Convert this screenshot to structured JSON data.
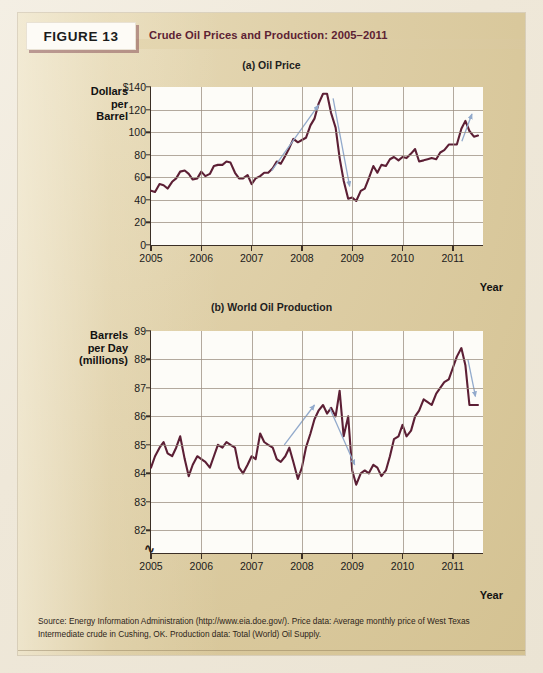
{
  "figure": {
    "label": "FIGURE 13",
    "title": "Crude Oil Prices and Production: 2005–2011",
    "source": "Source: Energy Information Administration (http://www.eia.doe.gov/). Price data: Average monthly price of West Texas Intermediate crude in Cushing, OK. Production data: Total (World) Oil Supply."
  },
  "colors": {
    "line": "#5c1f35",
    "arrow": "#92aacc",
    "panel": "#ddcda4",
    "plot_bg": "#fdfcf8",
    "grid": "#9a8e80",
    "axis": "#3b2f26",
    "title_text": "#5d2233"
  },
  "chart_data": [
    {
      "type": "line",
      "id": "oil-price",
      "title": "(a) Oil Price",
      "ylabel": "Dollars per Barrel",
      "ylabel_lines": [
        "Dollars",
        "per",
        "Barrel"
      ],
      "xlabel": "Year",
      "ytick_labels": [
        "$140",
        "120",
        "100",
        "80",
        "60",
        "40",
        "20",
        "0"
      ],
      "yticks": [
        140,
        120,
        100,
        80,
        60,
        40,
        20,
        0
      ],
      "ylim": [
        0,
        140
      ],
      "xlim": [
        2005.0,
        2011.6
      ],
      "xticks": [
        2005,
        2006,
        2007,
        2008,
        2009,
        2010,
        2011
      ],
      "xtick_labels": [
        "2005",
        "2006",
        "2007",
        "2008",
        "2009",
        "2010",
        "2011"
      ],
      "grid": true,
      "units": "US dollars per barrel",
      "series": [
        {
          "name": "WTI crude spot price",
          "x": [
            2005.0,
            2005.08,
            2005.17,
            2005.25,
            2005.33,
            2005.42,
            2005.5,
            2005.58,
            2005.67,
            2005.75,
            2005.83,
            2005.92,
            2006.0,
            2006.08,
            2006.17,
            2006.25,
            2006.33,
            2006.42,
            2006.5,
            2006.58,
            2006.67,
            2006.75,
            2006.83,
            2006.92,
            2007.0,
            2007.08,
            2007.17,
            2007.25,
            2007.33,
            2007.42,
            2007.5,
            2007.58,
            2007.67,
            2007.75,
            2007.83,
            2007.92,
            2008.0,
            2008.08,
            2008.17,
            2008.25,
            2008.33,
            2008.42,
            2008.5,
            2008.58,
            2008.67,
            2008.75,
            2008.83,
            2008.92,
            2009.0,
            2009.08,
            2009.17,
            2009.25,
            2009.33,
            2009.42,
            2009.5,
            2009.58,
            2009.67,
            2009.75,
            2009.83,
            2009.92,
            2010.0,
            2010.08,
            2010.17,
            2010.25,
            2010.33,
            2010.42,
            2010.5,
            2010.58,
            2010.67,
            2010.75,
            2010.83,
            2010.92,
            2011.0,
            2011.08,
            2011.17,
            2011.25,
            2011.33,
            2011.42,
            2011.5
          ],
          "y": [
            48,
            47,
            54,
            53,
            50,
            56,
            59,
            65,
            66,
            63,
            58,
            59,
            65,
            61,
            63,
            70,
            71,
            71,
            74,
            73,
            64,
            59,
            59,
            62,
            54,
            59,
            61,
            64,
            64,
            68,
            74,
            72,
            79,
            86,
            94,
            91,
            93,
            95,
            106,
            112,
            125,
            134,
            134,
            117,
            104,
            77,
            57,
            41,
            42,
            39,
            48,
            50,
            59,
            70,
            64,
            71,
            70,
            76,
            78,
            75,
            78,
            77,
            81,
            85,
            74,
            75,
            76,
            77,
            76,
            82,
            84,
            89,
            89,
            89,
            103,
            110,
            101,
            96,
            97
          ],
          "color": "#5c1f35"
        }
      ],
      "annotations": [
        {
          "type": "arrow",
          "direction": "up-right",
          "meaning": "price rising sharply 2007–2008",
          "x1": 2007.4,
          "y1": 66,
          "x2": 2008.33,
          "y2": 124
        },
        {
          "type": "arrow",
          "direction": "down-right",
          "meaning": "price collapsing late 2008",
          "x1": 2008.62,
          "y1": 130,
          "x2": 2008.95,
          "y2": 52
        },
        {
          "type": "arrow",
          "direction": "up-right",
          "meaning": "price rising again 2011",
          "x1": 2011.18,
          "y1": 92,
          "x2": 2011.38,
          "y2": 116
        }
      ]
    },
    {
      "type": "line",
      "id": "world-oil-production",
      "title": "(b) World Oil Production",
      "ylabel": "Barrels per Day (millions)",
      "ylabel_lines": [
        "Barrels",
        "per Day",
        "(millions)"
      ],
      "xlabel": "Year",
      "ytick_labels": [
        "89",
        "88",
        "87",
        "86",
        "85",
        "84",
        "83",
        "82"
      ],
      "yticks": [
        89,
        88,
        87,
        86,
        85,
        84,
        83,
        82
      ],
      "ylim": [
        81.2,
        89
      ],
      "axis_break": true,
      "xlim": [
        2005.0,
        2011.6
      ],
      "xticks": [
        2005,
        2006,
        2007,
        2008,
        2009,
        2010,
        2011
      ],
      "xtick_labels": [
        "2005",
        "2006",
        "2007",
        "2008",
        "2009",
        "2010",
        "2011"
      ],
      "grid": true,
      "units": "millions of barrels per day",
      "series": [
        {
          "name": "Total (World) Oil Supply",
          "x": [
            2005.0,
            2005.08,
            2005.17,
            2005.25,
            2005.33,
            2005.42,
            2005.5,
            2005.58,
            2005.67,
            2005.75,
            2005.83,
            2005.92,
            2006.0,
            2006.08,
            2006.17,
            2006.25,
            2006.33,
            2006.42,
            2006.5,
            2006.58,
            2006.67,
            2006.75,
            2006.83,
            2006.92,
            2007.0,
            2007.08,
            2007.17,
            2007.25,
            2007.33,
            2007.42,
            2007.5,
            2007.58,
            2007.67,
            2007.75,
            2007.83,
            2007.92,
            2008.0,
            2008.08,
            2008.17,
            2008.25,
            2008.33,
            2008.42,
            2008.5,
            2008.58,
            2008.67,
            2008.75,
            2008.83,
            2008.92,
            2009.0,
            2009.08,
            2009.17,
            2009.25,
            2009.33,
            2009.42,
            2009.5,
            2009.58,
            2009.67,
            2009.75,
            2009.83,
            2009.92,
            2010.0,
            2010.08,
            2010.17,
            2010.25,
            2010.33,
            2010.42,
            2010.5,
            2010.58,
            2010.67,
            2010.75,
            2010.83,
            2010.92,
            2011.0,
            2011.08,
            2011.17,
            2011.25,
            2011.33,
            2011.42,
            2011.5
          ],
          "y": [
            84.2,
            84.6,
            84.9,
            85.1,
            84.7,
            84.6,
            84.9,
            85.3,
            84.5,
            83.9,
            84.3,
            84.6,
            84.5,
            84.4,
            84.2,
            84.6,
            85.0,
            84.9,
            85.1,
            85.0,
            84.9,
            84.2,
            84.0,
            84.3,
            84.6,
            84.5,
            85.4,
            85.1,
            85.0,
            84.9,
            84.5,
            84.4,
            84.6,
            84.9,
            84.4,
            83.8,
            84.2,
            84.9,
            85.4,
            85.9,
            86.2,
            86.4,
            86.1,
            86.3,
            86.0,
            86.9,
            85.3,
            86.0,
            84.1,
            83.6,
            84.0,
            84.1,
            84.0,
            84.3,
            84.2,
            83.9,
            84.1,
            84.6,
            85.2,
            85.3,
            85.7,
            85.3,
            85.5,
            86.0,
            86.2,
            86.6,
            86.5,
            86.4,
            86.8,
            87.0,
            87.2,
            87.3,
            87.7,
            88.1,
            88.4,
            87.8,
            86.4,
            86.4,
            86.4
          ],
          "color": "#5c1f35"
        }
      ],
      "annotations": [
        {
          "type": "arrow",
          "direction": "up-right",
          "meaning": "production rising 2007–2008",
          "x1": 2007.65,
          "y1": 85.0,
          "x2": 2008.25,
          "y2": 86.4
        },
        {
          "type": "arrow",
          "direction": "down-right",
          "meaning": "production falling late 2008",
          "x1": 2008.55,
          "y1": 86.3,
          "x2": 2009.05,
          "y2": 84.3
        },
        {
          "type": "arrow",
          "direction": "down-right",
          "meaning": "production dip 2011",
          "x1": 2011.3,
          "y1": 88.0,
          "x2": 2011.45,
          "y2": 86.7
        }
      ]
    }
  ]
}
